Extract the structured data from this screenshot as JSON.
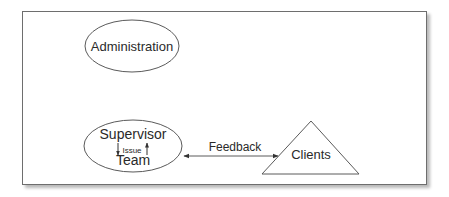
{
  "diagram": {
    "nodes": {
      "administration": {
        "label": "Administration",
        "shape": "ellipse"
      },
      "supervisor_team": {
        "label_top": "Supervisor",
        "label_bottom": "Team",
        "inner_label": "Issue",
        "shape": "ellipse"
      },
      "clients": {
        "label": "Clients",
        "shape": "triangle"
      }
    },
    "edges": {
      "feedback": {
        "label": "Feedback",
        "from": "Supervisor/Team",
        "to": "Clients",
        "direction": "bidirectional"
      }
    },
    "colors": {
      "stroke": "#5a5a5a",
      "text": "#2a2a2a",
      "background": "#ffffff"
    }
  }
}
